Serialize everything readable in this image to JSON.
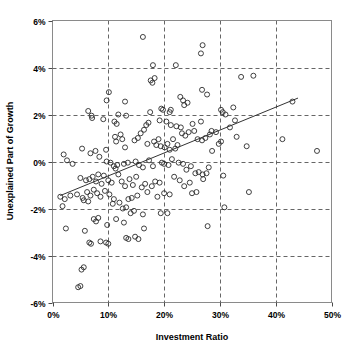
{
  "chart_data": {
    "type": "scatter",
    "title": "",
    "xlabel": "Investment Ratio",
    "ylabel": "Unexplained Part of Growth",
    "xlim": [
      0,
      50
    ],
    "ylim": [
      -6,
      6
    ],
    "xtick_labels": [
      "0%",
      "10%",
      "20%",
      "30%",
      "40%",
      "50%"
    ],
    "xticks": [
      0,
      10,
      20,
      30,
      40,
      50
    ],
    "ytick_labels": [
      "6%",
      "4%",
      "2%",
      "0%",
      "-2%",
      "-4%",
      "-6%"
    ],
    "yticks": [
      6,
      4,
      2,
      0,
      -2,
      -4,
      -6
    ],
    "grid": true,
    "legend": null,
    "marker": "open-circle",
    "series": [
      {
        "name": "observations",
        "points": [
          [
            16.2,
            5.3
          ],
          [
            26.9,
            4.95
          ],
          [
            26.6,
            4.6
          ],
          [
            18.0,
            4.1
          ],
          [
            22.1,
            4.1
          ],
          [
            17.6,
            3.45
          ],
          [
            17.9,
            3.35
          ],
          [
            18.3,
            3.55
          ],
          [
            33.8,
            3.6
          ],
          [
            36.0,
            3.65
          ],
          [
            10.1,
            2.95
          ],
          [
            26.8,
            3.05
          ],
          [
            27.7,
            2.85
          ],
          [
            9.7,
            2.6
          ],
          [
            13.0,
            2.55
          ],
          [
            22.9,
            2.75
          ],
          [
            23.4,
            2.6
          ],
          [
            24.2,
            2.5
          ],
          [
            23.6,
            2.4
          ],
          [
            6.4,
            2.15
          ],
          [
            7.1,
            1.85
          ],
          [
            7.0,
            1.95
          ],
          [
            9.1,
            1.8
          ],
          [
            11.8,
            2.0
          ],
          [
            13.2,
            1.95
          ],
          [
            17.5,
            2.1
          ],
          [
            19.5,
            2.25
          ],
          [
            19.8,
            2.2
          ],
          [
            21.0,
            2.1
          ],
          [
            21.2,
            2.2
          ],
          [
            30.2,
            2.2
          ],
          [
            30.5,
            2.1
          ],
          [
            31.0,
            2.0
          ],
          [
            32.4,
            2.3
          ],
          [
            43.0,
            2.55
          ],
          [
            11.1,
            1.7
          ],
          [
            11.5,
            1.6
          ],
          [
            16.8,
            1.55
          ],
          [
            17.2,
            1.65
          ],
          [
            19.2,
            1.75
          ],
          [
            20.4,
            1.7
          ],
          [
            21.2,
            1.55
          ],
          [
            22.2,
            1.5
          ],
          [
            23.0,
            1.45
          ],
          [
            25.1,
            1.6
          ],
          [
            26.6,
            1.7
          ],
          [
            28.5,
            1.3
          ],
          [
            29.3,
            1.25
          ],
          [
            31.8,
            1.45
          ],
          [
            32.7,
            1.75
          ],
          [
            5.3,
            0.55
          ],
          [
            6.8,
            0.35
          ],
          [
            7.7,
            0.45
          ],
          [
            8.4,
            0.2
          ],
          [
            9.6,
            0.5
          ],
          [
            11.2,
            1.05
          ],
          [
            11.4,
            0.85
          ],
          [
            12.2,
            1.15
          ],
          [
            12.5,
            0.95
          ],
          [
            13.0,
            0.6
          ],
          [
            14.7,
            0.9
          ],
          [
            15.3,
            1.0
          ],
          [
            15.8,
            1.2
          ],
          [
            16.4,
            1.35
          ],
          [
            17.0,
            0.75
          ],
          [
            18.2,
            0.85
          ],
          [
            18.6,
            0.7
          ],
          [
            19.0,
            0.95
          ],
          [
            19.4,
            0.65
          ],
          [
            20.1,
            0.6
          ],
          [
            20.6,
            0.75
          ],
          [
            21.0,
            0.5
          ],
          [
            21.6,
            0.95
          ],
          [
            22.0,
            0.55
          ],
          [
            22.4,
            0.7
          ],
          [
            23.2,
            1.2
          ],
          [
            23.8,
            1.1
          ],
          [
            24.4,
            1.25
          ],
          [
            25.4,
            1.3
          ],
          [
            26.0,
            0.95
          ],
          [
            26.8,
            0.9
          ],
          [
            27.4,
            1.0
          ],
          [
            28.2,
            1.15
          ],
          [
            29.8,
            0.75
          ],
          [
            30.2,
            0.85
          ],
          [
            33.0,
            1.05
          ],
          [
            34.8,
            0.65
          ],
          [
            41.2,
            0.95
          ],
          [
            47.4,
            0.45
          ],
          [
            2.0,
            0.3
          ],
          [
            2.6,
            0.05
          ],
          [
            3.6,
            -0.1
          ],
          [
            9.7,
            0.0
          ],
          [
            10.4,
            -0.05
          ],
          [
            11.0,
            -0.2
          ],
          [
            11.3,
            -0.3
          ],
          [
            11.6,
            -0.15
          ],
          [
            12.8,
            -0.1
          ],
          [
            13.5,
            -0.05
          ],
          [
            14.9,
            0.0
          ],
          [
            15.5,
            -0.15
          ],
          [
            16.2,
            -0.25
          ],
          [
            17.3,
            0.05
          ],
          [
            18.0,
            -0.2
          ],
          [
            19.6,
            -0.05
          ],
          [
            20.0,
            -0.1
          ],
          [
            20.8,
            -0.15
          ],
          [
            21.4,
            0.1
          ],
          [
            22.6,
            -0.05
          ],
          [
            23.4,
            -0.1
          ],
          [
            24.0,
            -0.35
          ],
          [
            24.8,
            -0.2
          ],
          [
            25.6,
            -0.5
          ],
          [
            26.2,
            -0.45
          ],
          [
            26.9,
            -0.55
          ],
          [
            27.6,
            -0.5
          ],
          [
            28.0,
            -0.25
          ],
          [
            28.6,
            0.45
          ],
          [
            5.0,
            -0.7
          ],
          [
            6.0,
            -0.8
          ],
          [
            6.6,
            -0.75
          ],
          [
            7.2,
            -0.65
          ],
          [
            7.8,
            -0.85
          ],
          [
            8.2,
            -0.55
          ],
          [
            8.8,
            -0.95
          ],
          [
            9.2,
            -0.6
          ],
          [
            10.0,
            -0.8
          ],
          [
            10.6,
            -0.9
          ],
          [
            11.8,
            -0.55
          ],
          [
            12.4,
            -0.85
          ],
          [
            13.0,
            -1.05
          ],
          [
            13.8,
            -0.75
          ],
          [
            14.4,
            -1.0
          ],
          [
            15.0,
            -0.65
          ],
          [
            16.0,
            -1.1
          ],
          [
            16.6,
            -0.95
          ],
          [
            17.8,
            -1.05
          ],
          [
            18.4,
            -0.85
          ],
          [
            19.2,
            -0.9
          ],
          [
            21.8,
            -0.65
          ],
          [
            22.8,
            -0.8
          ],
          [
            23.6,
            -1.05
          ],
          [
            24.6,
            -0.9
          ],
          [
            25.0,
            -1.35
          ],
          [
            25.8,
            -1.3
          ],
          [
            27.0,
            -0.75
          ],
          [
            30.6,
            -0.6
          ],
          [
            1.4,
            -1.5
          ],
          [
            2.2,
            -1.6
          ],
          [
            3.2,
            -1.45
          ],
          [
            4.4,
            -1.4
          ],
          [
            5.4,
            -1.55
          ],
          [
            6.2,
            -1.3
          ],
          [
            6.8,
            -1.45
          ],
          [
            7.4,
            -1.2
          ],
          [
            8.0,
            -1.35
          ],
          [
            8.6,
            -1.5
          ],
          [
            9.4,
            -1.25
          ],
          [
            10.2,
            -1.4
          ],
          [
            11.0,
            -1.6
          ],
          [
            12.0,
            -1.75
          ],
          [
            13.6,
            -1.6
          ],
          [
            14.2,
            -1.55
          ],
          [
            15.2,
            -1.45
          ],
          [
            17.0,
            -1.3
          ],
          [
            20.0,
            -1.35
          ],
          [
            21.0,
            -1.4
          ],
          [
            18.8,
            -1.5
          ],
          [
            35.2,
            -1.3
          ],
          [
            1.8,
            -1.9
          ],
          [
            5.6,
            -1.65
          ],
          [
            6.4,
            -1.7
          ],
          [
            10.8,
            -1.8
          ],
          [
            12.6,
            -2.0
          ],
          [
            13.2,
            -1.95
          ],
          [
            14.0,
            -2.2
          ],
          [
            14.6,
            -2.1
          ],
          [
            16.2,
            -2.25
          ],
          [
            19.4,
            -2.2
          ],
          [
            20.6,
            -2.2
          ],
          [
            30.8,
            -1.95
          ],
          [
            2.4,
            -2.85
          ],
          [
            5.8,
            -2.95
          ],
          [
            7.4,
            -2.45
          ],
          [
            7.8,
            -2.55
          ],
          [
            8.2,
            -2.4
          ],
          [
            9.8,
            -2.7
          ],
          [
            11.4,
            -2.45
          ],
          [
            12.8,
            -2.6
          ],
          [
            16.4,
            -2.85
          ],
          [
            27.8,
            -2.75
          ],
          [
            6.6,
            -3.45
          ],
          [
            6.9,
            -3.5
          ],
          [
            8.6,
            -3.4
          ],
          [
            9.6,
            -3.45
          ],
          [
            10.0,
            -3.5
          ],
          [
            13.2,
            -3.25
          ],
          [
            13.6,
            -3.3
          ],
          [
            14.8,
            -3.2
          ],
          [
            15.4,
            -3.3
          ],
          [
            5.2,
            -4.6
          ],
          [
            5.6,
            -4.5
          ],
          [
            4.6,
            -5.35
          ],
          [
            5.0,
            -5.3
          ]
        ]
      }
    ],
    "trendline": {
      "name": "fitted regression line",
      "x_start": 1.4,
      "y_start": -1.45,
      "x_end": 44.0,
      "y_end": 2.7
    }
  }
}
